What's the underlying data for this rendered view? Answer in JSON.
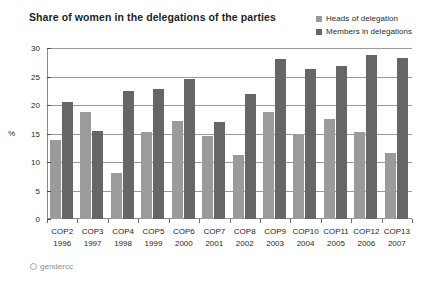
{
  "chart_data": {
    "type": "bar",
    "title": "Share of women in the delegations of the parties",
    "xlabel": "",
    "ylabel": "%",
    "ylim": [
      0,
      30
    ],
    "yticks": [
      0,
      5,
      10,
      15,
      20,
      25,
      30
    ],
    "grid": true,
    "legend_position": "top-right",
    "categories": [
      "COP2",
      "COP3",
      "COP4",
      "COP5",
      "COP6",
      "COP7",
      "COP8",
      "COP9",
      "COP10",
      "COP11",
      "COP12",
      "COP13"
    ],
    "category_years": [
      "1996",
      "1997",
      "1998",
      "1999",
      "2000",
      "2001",
      "2002",
      "2003",
      "2004",
      "2005",
      "2006",
      "2007"
    ],
    "series": [
      {
        "name": "Heads of delegation",
        "color": "#9b9b9b",
        "values": [
          13.8,
          18.8,
          8.0,
          15.2,
          17.2,
          14.6,
          11.2,
          18.8,
          14.8,
          17.5,
          15.2,
          11.5
        ]
      },
      {
        "name": "Members in delegations",
        "color": "#666666",
        "values": [
          20.5,
          15.4,
          22.5,
          22.8,
          24.5,
          17.0,
          22.0,
          28.0,
          26.4,
          26.8,
          28.8,
          28.2
        ]
      }
    ],
    "credit": "gendercc"
  }
}
